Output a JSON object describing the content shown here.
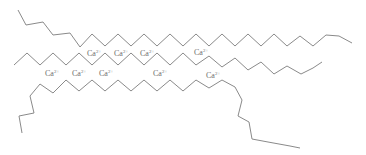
{
  "diagram": {
    "ion_label": "Ca",
    "ion_charge": "2+",
    "colors": {
      "bond": "#8a8a8a",
      "label": "#6e6e6e"
    },
    "ions": [
      {
        "id": "ion-1",
        "x": 87,
        "y": 49
      },
      {
        "id": "ion-2",
        "x": 114,
        "y": 49
      },
      {
        "id": "ion-3",
        "x": 140,
        "y": 49
      },
      {
        "id": "ion-4",
        "x": 194,
        "y": 48
      },
      {
        "id": "ion-5",
        "x": 45,
        "y": 69
      },
      {
        "id": "ion-6",
        "x": 72,
        "y": 69
      },
      {
        "id": "ion-7",
        "x": 99,
        "y": 69
      },
      {
        "id": "ion-8",
        "x": 153,
        "y": 69
      },
      {
        "id": "ion-9",
        "x": 206,
        "y": 71
      }
    ],
    "chains": [
      {
        "id": "chain-top",
        "points": "18,10 26,25 43,22 53,35 70,33 80,47 92,34 105,46 118,34 131,46 144,34 157,46 170,34 183,46 196,34 209,46 222,34 235,46 248,34 261,46 274,34 287,46 300,36 313,46 326,35 339,36 352,43"
      },
      {
        "id": "chain-middle",
        "points": "14,65 27,53 40,65 53,53 66,65 79,53 92,65 105,53 118,65 131,53 144,65 157,53 170,65 183,53 196,65 209,56 222,67 235,58 248,70 261,62 274,74 287,66 301,74 313,68 322,62"
      },
      {
        "id": "chain-bottom",
        "points": "22,133 19,116 34,113 30,96 40,84 53,93 66,80 79,91 92,80 105,91 118,80 131,91 144,80 157,91 170,80 183,91 196,80 209,88 222,80 235,87 242,100 238,116 249,122 252,139 268,142 290,146 300,148"
      }
    ]
  }
}
